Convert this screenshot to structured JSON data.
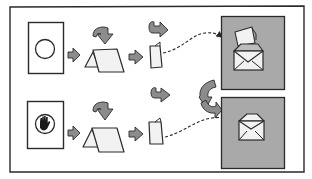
{
  "diagram": {
    "title": "",
    "colors": {
      "background": "#ffffff",
      "ink": "#2a2a2a",
      "arrow_fill": "#8c8c8c",
      "panel_fill": "#a9a9a9",
      "paper_fill": "#f2f2f2",
      "hand_fill": "#1a1a1a"
    },
    "rows": [
      {
        "id": "row-top",
        "source_icon": "circle-icon",
        "steps": [
          "card",
          "fold-card",
          "folded-card",
          "envelope-with-letter"
        ]
      },
      {
        "id": "row-bottom",
        "source_icon": "hand-stop-icon",
        "steps": [
          "card",
          "fold-card",
          "folded-card",
          "open-envelope"
        ]
      }
    ],
    "connectors": [
      {
        "from": "row-top.folded-card",
        "to": "row-top.envelope",
        "style": "dashed"
      },
      {
        "from": "row-bottom.folded-card",
        "to": "row-bottom.envelope",
        "style": "dashed"
      }
    ]
  }
}
